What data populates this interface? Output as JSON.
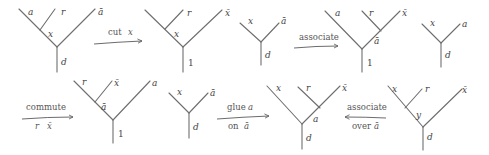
{
  "diagram": {
    "row1": {
      "tree1": {
        "labels": {
          "a": "a",
          "r": "r",
          "abar": "ā",
          "inner": "x",
          "root": "d"
        }
      },
      "arrow1": {
        "label": "cut",
        "label_var": "x"
      },
      "tree2": {
        "labels": {
          "a": "a",
          "r": "r",
          "xbar": "x̄",
          "inner": "x",
          "root": "1"
        }
      },
      "tree3": {
        "labels": {
          "x": "x",
          "abar": "ā",
          "root": "d"
        }
      },
      "arrow2": {
        "label": "associate"
      },
      "tree4": {
        "labels": {
          "a": "a",
          "r": "r",
          "xbar": "x̄",
          "inner": "ā",
          "root": "1"
        }
      },
      "tree5": {
        "labels": {
          "x": "x",
          "a": "a",
          "root": "d"
        }
      }
    },
    "row2": {
      "arrow3": {
        "label": "commute",
        "sublabel_r": "r",
        "sublabel_x": "x̄"
      },
      "tree6": {
        "labels": {
          "r": "r",
          "xbar": "x̄",
          "a": "a",
          "inner": "ā",
          "root": "1"
        }
      },
      "tree7": {
        "labels": {
          "x": "x",
          "abar": "ā",
          "root": "d"
        }
      },
      "arrow4": {
        "label": "glue",
        "label_var": "a",
        "sublabel": "on",
        "sublabel_var": "ā"
      },
      "tree8": {
        "labels": {
          "x": "x",
          "r": "r",
          "xbar": "x̄",
          "inner": "a",
          "root": "d"
        }
      },
      "arrow5": {
        "label": "associate",
        "sublabel": "over",
        "sublabel_var": "ā"
      },
      "tree9": {
        "labels": {
          "x": "x",
          "r": "r",
          "xbar": "x̄",
          "inner": "y",
          "root": "d"
        }
      }
    }
  }
}
